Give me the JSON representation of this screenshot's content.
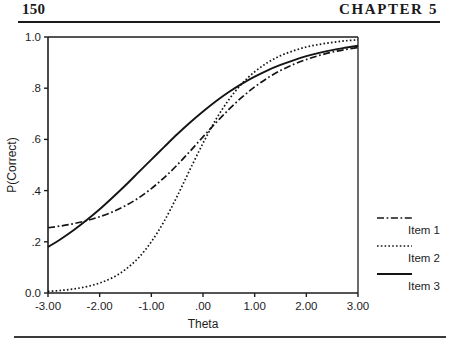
{
  "page": {
    "number": "150",
    "chapter": "CHAPTER 5"
  },
  "chart_data": {
    "type": "line",
    "title": "",
    "xlabel": "Theta",
    "ylabel": "P(Correct)",
    "xlim": [
      -3.0,
      3.0
    ],
    "ylim": [
      0.0,
      1.0
    ],
    "grid": false,
    "legend_position": "right",
    "x_tick_labels": [
      "-3.00",
      "-2.00",
      "-1.00",
      ".00",
      "1.00",
      "2.00",
      "3.00"
    ],
    "x_tick_values": [
      -3,
      -2,
      -1,
      0,
      1,
      2,
      3
    ],
    "y_tick_labels": [
      "0.0",
      ".2",
      ".4",
      ".6",
      ".8",
      "1.0"
    ],
    "y_tick_values": [
      0.0,
      0.2,
      0.4,
      0.6,
      0.8,
      1.0
    ],
    "x": [
      -3.0,
      -2.75,
      -2.5,
      -2.25,
      -2.0,
      -1.75,
      -1.5,
      -1.25,
      -1.0,
      -0.75,
      -0.5,
      -0.25,
      0.0,
      0.25,
      0.5,
      0.75,
      1.0,
      1.25,
      1.5,
      1.75,
      2.0,
      2.25,
      2.5,
      2.75,
      3.0
    ],
    "series": [
      {
        "name": "Item 1",
        "style": "dash-dot",
        "color": "#141414",
        "values": [
          0.255,
          0.262,
          0.271,
          0.283,
          0.298,
          0.317,
          0.341,
          0.371,
          0.408,
          0.451,
          0.5,
          0.554,
          0.61,
          0.665,
          0.717,
          0.764,
          0.805,
          0.84,
          0.869,
          0.893,
          0.912,
          0.928,
          0.941,
          0.951,
          0.959
        ]
      },
      {
        "name": "Item 2",
        "style": "dotted",
        "color": "#141414",
        "values": [
          0.006,
          0.01,
          0.016,
          0.025,
          0.039,
          0.06,
          0.092,
          0.137,
          0.2,
          0.281,
          0.378,
          0.483,
          0.585,
          0.678,
          0.755,
          0.817,
          0.864,
          0.9,
          0.927,
          0.946,
          0.961,
          0.971,
          0.979,
          0.985,
          0.989
        ]
      },
      {
        "name": "Item 3",
        "style": "solid",
        "color": "#141414",
        "values": [
          0.18,
          0.211,
          0.246,
          0.285,
          0.327,
          0.373,
          0.421,
          0.471,
          0.521,
          0.571,
          0.62,
          0.666,
          0.709,
          0.749,
          0.785,
          0.817,
          0.845,
          0.87,
          0.891,
          0.909,
          0.925,
          0.938,
          0.949,
          0.958,
          0.966
        ]
      }
    ],
    "legend_entries": [
      {
        "label": "Item 1",
        "style": "dash-dot"
      },
      {
        "label": "Item 2",
        "style": "dotted"
      },
      {
        "label": "Item 3",
        "style": "solid"
      }
    ]
  }
}
